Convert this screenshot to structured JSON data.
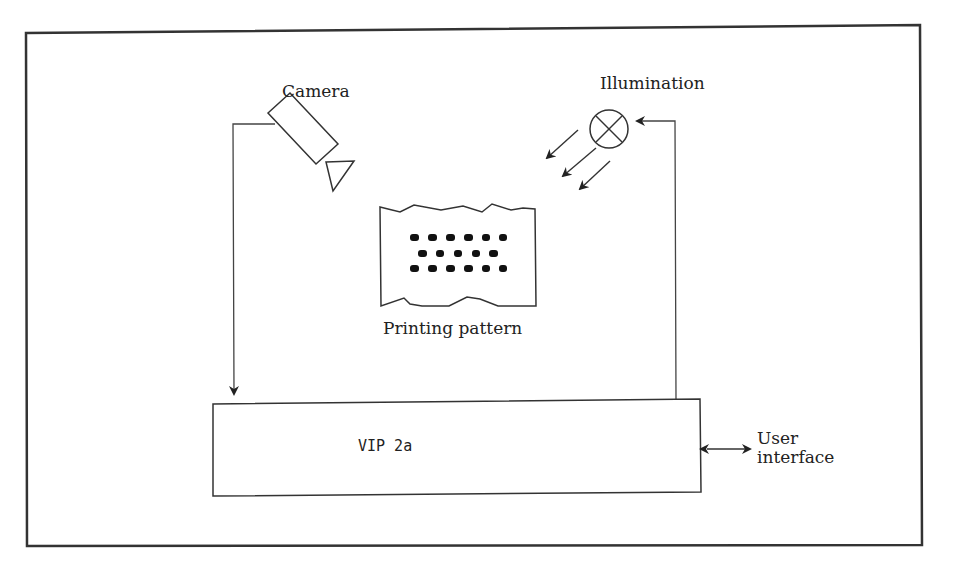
{
  "diagram": {
    "labels": {
      "camera": "Camera",
      "illumination": "Illumination",
      "pattern": "Printing pattern",
      "processor": "VIP 2a",
      "user_interface_line1": "User",
      "user_interface_line2": "interface"
    },
    "nodes": [
      {
        "id": "camera",
        "label": "Camera",
        "shape": "camera-icon"
      },
      {
        "id": "illumination",
        "label": "Illumination",
        "shape": "lamp-icon"
      },
      {
        "id": "pattern",
        "label": "Printing pattern",
        "shape": "torn-sheet with dot rows"
      },
      {
        "id": "processor",
        "label": "VIP 2a",
        "shape": "rectangle"
      },
      {
        "id": "user_interface",
        "label": "User interface",
        "shape": "text"
      }
    ],
    "edges": [
      {
        "from": "camera",
        "to": "processor",
        "style": "arrow"
      },
      {
        "from": "processor",
        "to": "illumination",
        "style": "arrow"
      },
      {
        "from": "processor",
        "to": "user_interface",
        "style": "double-arrow"
      },
      {
        "from": "illumination",
        "to": "pattern",
        "style": "light-rays (3 arrows)"
      }
    ],
    "pattern_dots": {
      "row1": 6,
      "row2": 5,
      "row3": 6
    },
    "colors": {
      "stroke": "#333333",
      "background": "#ffffff",
      "text": "#222222"
    }
  }
}
